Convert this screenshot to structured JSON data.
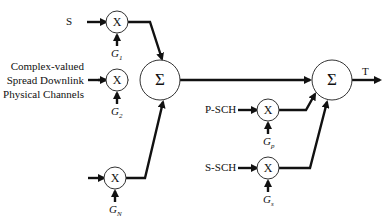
{
  "diagram": {
    "inputs": {
      "s": "S",
      "complex_line1": "Complex-valued",
      "complex_line2": "Spread Downlink",
      "complex_line3": "Physical Channels",
      "p_sch": "P-SCH",
      "s_sch": "S-SCH"
    },
    "multipliers": {
      "x1": "X",
      "x2": "X",
      "xn": "X",
      "xp": "X",
      "xs": "X"
    },
    "gains": {
      "g1": {
        "base": "G",
        "sub": "1"
      },
      "g2": {
        "base": "G",
        "sub": "2"
      },
      "gn": {
        "base": "G",
        "sub": "N"
      },
      "gp": {
        "base": "G",
        "sub": "p"
      },
      "gs": {
        "base": "G",
        "sub": "s"
      }
    },
    "summers": {
      "sum1": "Σ",
      "sum2": "Σ"
    },
    "output": "T"
  }
}
